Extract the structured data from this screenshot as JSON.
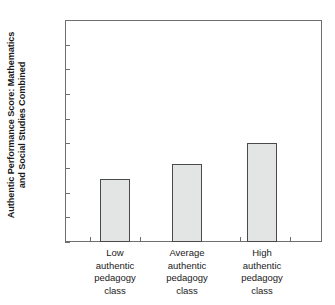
{
  "chart_data": {
    "type": "bar",
    "title": "",
    "xlabel": "",
    "ylabel": "Authentic Performance Score: Mathematics and Social Studies Combined",
    "ylabel_lines": [
      "Authentic Performance Score: Mathematics",
      "and Social Studies Combined"
    ],
    "categories": [
      "Low authentic pedagogy class",
      "Average authentic pedagogy class",
      "High authentic pedagogy class"
    ],
    "category_lines": [
      [
        "Low",
        "authentic",
        "pedagogy",
        "class"
      ],
      [
        "Average",
        "authentic",
        "pedagogy",
        "class"
      ],
      [
        "High",
        "authentic",
        "pedagogy",
        "class"
      ]
    ],
    "values": [
      5.55,
      6.15,
      7.0
    ],
    "ylim": [
      3,
      12
    ],
    "yticks": [
      3,
      4,
      5,
      6,
      7,
      8,
      9,
      10,
      11,
      12
    ],
    "ytick_labels": [
      "3",
      "4",
      "5",
      "6",
      "7",
      "8",
      "9",
      "10",
      "11",
      "12"
    ],
    "grid": false,
    "legend": null,
    "bar_fill_color": "#e3e5e5",
    "bar_edge_color": "#4a4a4a",
    "axis_color": "#6e6e6e",
    "background_color": "#ffffff"
  }
}
